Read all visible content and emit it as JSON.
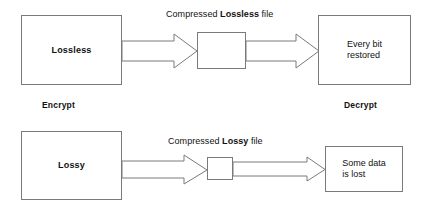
{
  "diagram": {
    "background_color": "#ffffff",
    "line_color": "#7a7a7a",
    "text_color": "#111111",
    "rows": [
      {
        "id": "lossless-row",
        "source_box": {
          "label": "Lossless",
          "bold": true
        },
        "flow_label": {
          "prefix": "Compressed ",
          "strong": "Lossless",
          "suffix": " file"
        },
        "middle_box": {
          "label": ""
        },
        "target_box": {
          "label": "Every bit\nrestored",
          "bold": false
        },
        "arrows": [
          {
            "name": "arrow-lossless-compress",
            "direction": "right"
          },
          {
            "name": "arrow-lossless-decompress",
            "direction": "right"
          }
        ]
      },
      {
        "id": "lossy-row",
        "source_box": {
          "label": "Lossy",
          "bold": true
        },
        "flow_label": {
          "prefix": "Compressed ",
          "strong": "Lossy",
          "suffix": " file"
        },
        "middle_box": {
          "label": ""
        },
        "target_box": {
          "label": "Some data\nis lost",
          "bold": false
        },
        "arrows": [
          {
            "name": "arrow-lossy-compress",
            "direction": "right"
          },
          {
            "name": "arrow-lossy-decompress",
            "direction": "right"
          }
        ]
      }
    ],
    "captions": {
      "encrypt": "Encrypt",
      "decrypt": "Decrypt"
    }
  }
}
